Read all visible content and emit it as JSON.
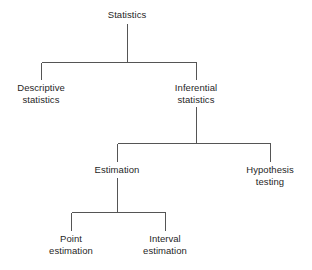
{
  "diagram": {
    "type": "tree",
    "stroke_color": "#555555",
    "text_color": "#1f1f1f",
    "background_color": "#ffffff",
    "nodes": [
      {
        "id": "statistics",
        "label": "Statistics",
        "line1": "Statistics",
        "line2": "",
        "level": 0,
        "cx": 127,
        "top": 9
      },
      {
        "id": "descriptive-statistics",
        "label": "Descriptive statistics",
        "line1": "Descriptive",
        "line2": "statistics",
        "level": 1,
        "cx": 41,
        "top": 82
      },
      {
        "id": "inferential-statistics",
        "label": "Inferential statistics",
        "line1": "Inferential",
        "line2": "statistics",
        "level": 1,
        "cx": 196,
        "top": 82
      },
      {
        "id": "estimation",
        "label": "Estimation",
        "line1": "Estimation",
        "line2": "",
        "level": 2,
        "cx": 117,
        "top": 164
      },
      {
        "id": "hypothesis-testing",
        "label": "Hypothesis testing",
        "line1": "Hypothesis",
        "line2": "testing",
        "level": 2,
        "cx": 270,
        "top": 164
      },
      {
        "id": "point-estimation",
        "label": "Point estimation",
        "line1": "Point",
        "line2": "estimation",
        "level": 3,
        "cx": 71,
        "top": 233
      },
      {
        "id": "interval-estimation",
        "label": "Interval estimation",
        "line1": "Interval",
        "line2": "estimation",
        "level": 3,
        "cx": 165,
        "top": 233
      }
    ],
    "edges": [
      {
        "from": "statistics",
        "to": "descriptive-statistics"
      },
      {
        "from": "statistics",
        "to": "inferential-statistics"
      },
      {
        "from": "inferential-statistics",
        "to": "estimation"
      },
      {
        "from": "inferential-statistics",
        "to": "hypothesis-testing"
      },
      {
        "from": "estimation",
        "to": "point-estimation"
      },
      {
        "from": "estimation",
        "to": "interval-estimation"
      }
    ]
  }
}
